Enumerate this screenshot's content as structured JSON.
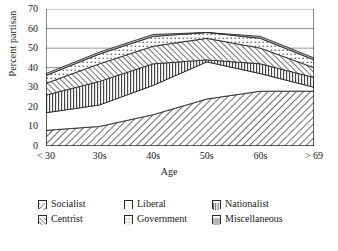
{
  "chart_data": {
    "type": "area",
    "stacked": true,
    "title": "",
    "xlabel": "Age",
    "ylabel": "Percent partisan",
    "categories": [
      "< 30",
      "30s",
      "40s",
      "50s",
      "60s",
      "> 69"
    ],
    "ylim": [
      0,
      70
    ],
    "yticks": [
      0,
      10,
      20,
      30,
      40,
      50,
      60,
      70
    ],
    "grid": "horizontal",
    "legend_position": "bottom",
    "series": [
      {
        "name": "Socialist",
        "pattern": "diagonal-hatch",
        "values": [
          8,
          10,
          16,
          24,
          28,
          28
        ]
      },
      {
        "name": "Liberal",
        "pattern": "blank",
        "values": [
          9,
          11,
          15,
          19,
          9,
          2
        ]
      },
      {
        "name": "Nationalist",
        "pattern": "vertical-lines",
        "values": [
          9,
          12,
          11,
          1,
          5,
          5
        ]
      },
      {
        "name": "Centrist",
        "pattern": "cross-diagonal-hatch",
        "values": [
          6,
          9,
          9,
          11,
          8,
          5
        ]
      },
      {
        "name": "Government",
        "pattern": "dotted",
        "values": [
          4,
          5,
          5,
          3,
          5,
          4
        ]
      },
      {
        "name": "Miscellaneous",
        "pattern": "light-solid",
        "values": [
          1,
          1,
          1,
          1,
          1,
          1
        ]
      }
    ],
    "cumulative_tops": [
      [
        8,
        10,
        16,
        24,
        28,
        28
      ],
      [
        17,
        21,
        31,
        43,
        37,
        30
      ],
      [
        26,
        33,
        42,
        44,
        42,
        35
      ],
      [
        32,
        42,
        51,
        55,
        50,
        40
      ],
      [
        36,
        47,
        56,
        58,
        55,
        44
      ],
      [
        37,
        48,
        57,
        58,
        56,
        45
      ]
    ]
  },
  "axes": {
    "y_title": "Percent partisan",
    "x_title": "Age",
    "y_tick_labels": [
      "70",
      "60",
      "50",
      "40",
      "30",
      "20",
      "10",
      "0"
    ],
    "x_tick_labels": [
      "< 30",
      "30s",
      "40s",
      "50s",
      "60s",
      "> 69"
    ]
  },
  "legend": {
    "rows": [
      [
        {
          "label": "Socialist",
          "pattern": "diagonal-hatch"
        },
        {
          "label": "Liberal",
          "pattern": "blank"
        },
        {
          "label": "Nationalist",
          "pattern": "vertical-lines"
        }
      ],
      [
        {
          "label": "Centrist",
          "pattern": "cross-diagonal-hatch"
        },
        {
          "label": "Government",
          "pattern": "dotted"
        },
        {
          "label": "Miscellaneous",
          "pattern": "light-solid"
        }
      ]
    ]
  },
  "colors": {
    "axis": "#1a1a1a",
    "grid": "#8a8a8a",
    "background": "#ffffff",
    "ink": "#2a2a2a"
  }
}
